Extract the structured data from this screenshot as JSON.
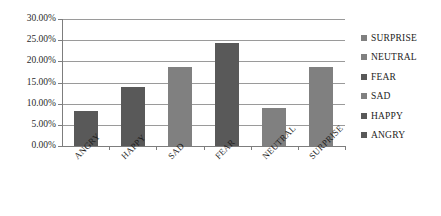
{
  "chart_data": {
    "type": "bar",
    "title": "",
    "subtitle": "",
    "xlabel": "",
    "ylabel": "",
    "categories": [
      "ANGRY",
      "HAPPY",
      "SAD",
      "FEAR",
      "NEUTRAL",
      "SURPRISE"
    ],
    "values": [
      8.3,
      14.0,
      18.7,
      24.3,
      9.0,
      18.7
    ],
    "value_labels": [
      "8.30%",
      "14.00%",
      "18.70%",
      "24.30%",
      "9.00%",
      "18.70%"
    ],
    "ylim": [
      0,
      30
    ],
    "ytick_values": [
      0,
      5,
      10,
      15,
      20,
      25,
      30
    ],
    "ytick_labels": [
      "0.00%",
      "5.00%",
      "10.00%",
      "15.00%",
      "20.00%",
      "25.00%",
      "30.00%"
    ],
    "grid": true,
    "grid_axis": "y",
    "legend_position": "right",
    "legend_entries": [
      {
        "label": "SURPRISE",
        "color": "#808080"
      },
      {
        "label": "NEUTRAL",
        "color": "#808080"
      },
      {
        "label": "FEAR",
        "color": "#595959"
      },
      {
        "label": "SAD",
        "color": "#808080"
      },
      {
        "label": "HAPPY",
        "color": "#595959"
      },
      {
        "label": "ANGRY",
        "color": "#595959"
      }
    ],
    "bar_colors": [
      "#595959",
      "#595959",
      "#808080",
      "#595959",
      "#808080",
      "#808080"
    ],
    "background_color": "#ffffff",
    "gridline_color": "#9a9a9a",
    "axis_color": "#7d7d7d",
    "tick_label_rotation": -45
  }
}
